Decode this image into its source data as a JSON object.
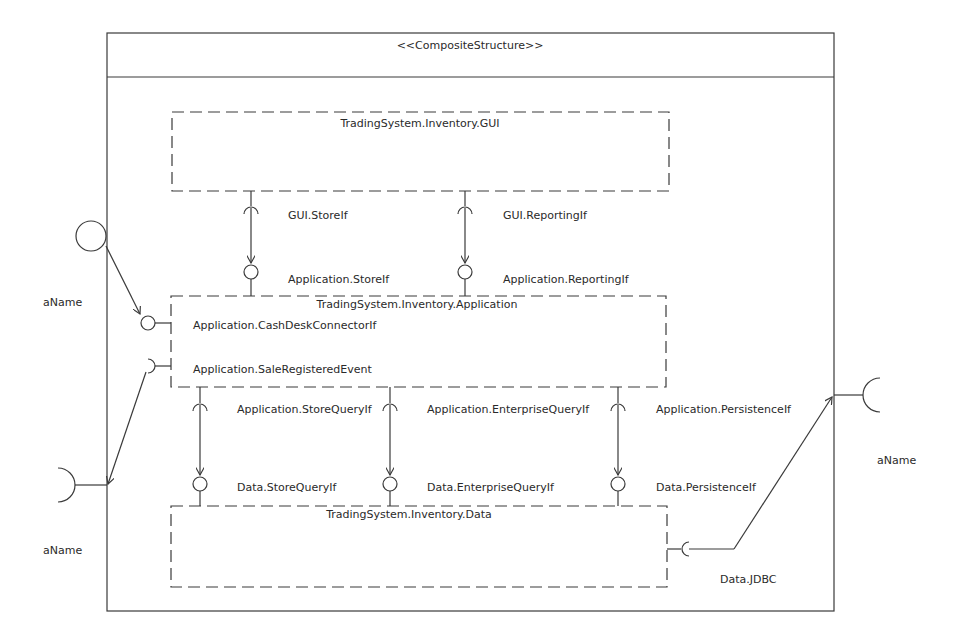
{
  "diagram": {
    "stereotype": "<<CompositeStructure>>",
    "colors": {
      "line": "#3a3a3a",
      "text": "#2a2a2a",
      "background": "#ffffff"
    },
    "parts": {
      "gui": {
        "name": "TradingSystem.Inventory.GUI"
      },
      "application": {
        "name": "TradingSystem.Inventory.Application",
        "ports": [
          "Application.CashDeskConnectorIf",
          "Application.SaleRegisteredEvent"
        ]
      },
      "data": {
        "name": "TradingSystem.Inventory.Data"
      }
    },
    "connectors": [
      {
        "required": "GUI.StoreIf",
        "provided": "Application.StoreIf"
      },
      {
        "required": "GUI.ReportingIf",
        "provided": "Application.ReportingIf"
      },
      {
        "required": "Application.StoreQueryIf",
        "provided": "Data.StoreQueryIf"
      },
      {
        "required": "Application.EnterpriseQueryIf",
        "provided": "Data.EnterpriseQueryIf"
      },
      {
        "required": "Application.PersistenceIf",
        "provided": "Data.PersistenceIf"
      }
    ],
    "data_port": "Data.JDBC",
    "external_ports": [
      {
        "label": "aName",
        "kind": "provided"
      },
      {
        "label": "aName",
        "kind": "required"
      },
      {
        "label": "aName",
        "kind": "required"
      }
    ]
  }
}
